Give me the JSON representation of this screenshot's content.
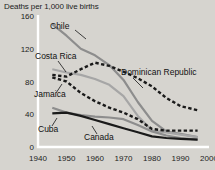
{
  "chart_data": {
    "type": "line",
    "title": "Deaths per 1,000 live births",
    "xlabel": "",
    "ylabel": "",
    "xlim": [
      1940,
      2000
    ],
    "ylim": [
      0,
      160
    ],
    "grid": false,
    "legend_position": "inline-labels",
    "xticks": [
      "1940",
      "1950",
      "1960",
      "1970",
      "1980",
      "1990",
      "2000"
    ],
    "yticks": [
      "0",
      "40",
      "80",
      "120",
      "160"
    ],
    "series": [
      {
        "name": "Chile",
        "style": "solid",
        "color": "#8d8d8d",
        "x": [
          1945,
          1950,
          1955,
          1960,
          1965,
          1970,
          1975,
          1980,
          1985,
          1990,
          1996
        ],
        "values": [
          150,
          136,
          120,
          112,
          100,
          82,
          55,
          32,
          19,
          16,
          12
        ]
      },
      {
        "name": "Costa Rica",
        "style": "solid",
        "color": "#a6a6a6",
        "x": [
          1945,
          1950,
          1955,
          1960,
          1965,
          1970,
          1975,
          1980,
          1985,
          1990,
          1996
        ],
        "values": [
          95,
          91,
          88,
          83,
          76,
          62,
          38,
          20,
          18,
          15,
          12
        ]
      },
      {
        "name": "Dominican Republic",
        "style": "dashed",
        "color": "#1a1a1a",
        "x": [
          1945,
          1950,
          1955,
          1960,
          1965,
          1970,
          1975,
          1980,
          1985,
          1990,
          1996
        ],
        "values": [
          88,
          86,
          95,
          103,
          99,
          92,
          84,
          74,
          60,
          50,
          45
        ]
      },
      {
        "name": "Jamaica",
        "style": "dashed",
        "color": "#1a1a1a",
        "x": [
          1945,
          1950,
          1955,
          1960,
          1965,
          1970,
          1975,
          1980,
          1985,
          1990,
          1996
        ],
        "values": [
          85,
          80,
          66,
          56,
          48,
          42,
          34,
          22,
          20,
          20,
          20
        ]
      },
      {
        "name": "Cuba",
        "style": "solid",
        "color": "#8d8d8d",
        "x": [
          1945,
          1950,
          1955,
          1960,
          1965,
          1970,
          1975,
          1980,
          1985,
          1990,
          1996
        ],
        "values": [
          48,
          42,
          39,
          37,
          36,
          34,
          27,
          19,
          14,
          11,
          9
        ]
      },
      {
        "name": "Canada",
        "style": "solid",
        "color": "#1a1a1a",
        "x": [
          1945,
          1950,
          1955,
          1960,
          1965,
          1970,
          1975,
          1980,
          1985,
          1990,
          1996
        ],
        "values": [
          41,
          42,
          38,
          33,
          28,
          23,
          18,
          13,
          11,
          10,
          9
        ]
      }
    ],
    "annotations": [
      {
        "text": "Chile",
        "x": 50,
        "y": 29
      },
      {
        "text": "Costa Rica",
        "x": 35,
        "y": 59
      },
      {
        "text": "Dominican Republic",
        "x": 121,
        "y": 75
      },
      {
        "text": "Jamaica",
        "x": 34,
        "y": 97
      },
      {
        "text": "Cuba",
        "x": 38,
        "y": 132
      },
      {
        "text": "Canada",
        "x": 84,
        "y": 140
      }
    ]
  },
  "colors": {
    "background": "#d6d4cf",
    "axis": "#ffffff",
    "text": "#1c1c1c"
  }
}
